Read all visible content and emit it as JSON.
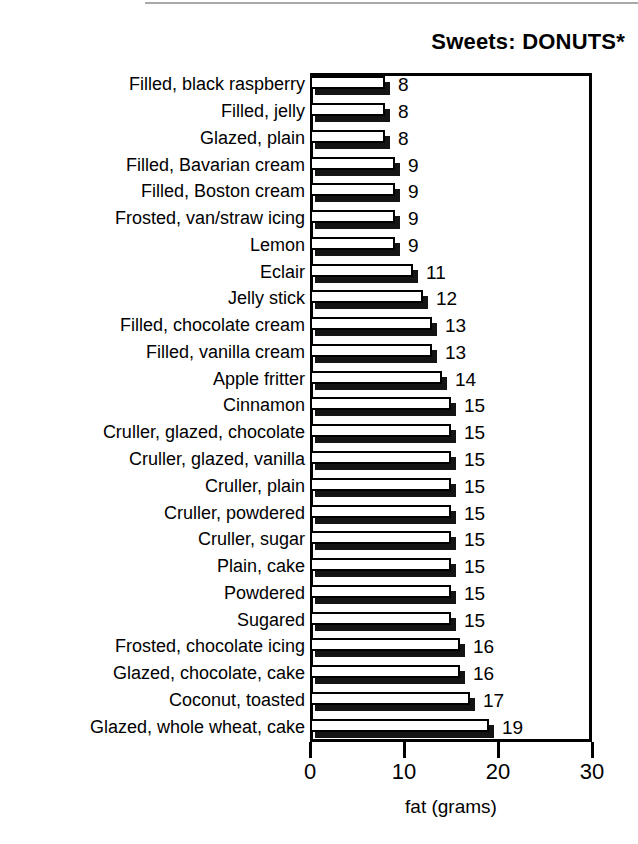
{
  "chart_data": {
    "type": "bar",
    "orientation": "horizontal",
    "title": "Sweets: DONUTS*",
    "xlabel": "fat (grams)",
    "ylabel": "",
    "xlim": [
      0,
      30
    ],
    "xticks": [
      0,
      10,
      20,
      30
    ],
    "xtick_labels": [
      "0",
      "10",
      "20",
      "30"
    ],
    "grid": false,
    "legend": false,
    "bar_style": "3d-extruded-white-face-black-shadow",
    "value_labels_shown": true,
    "categories": [
      "Filled, black raspberry",
      "Filled, jelly",
      "Glazed, plain",
      "Filled, Bavarian cream",
      "Filled, Boston cream",
      "Frosted, van/straw icing",
      "Lemon",
      "Eclair",
      "Jelly stick",
      "Filled, chocolate cream",
      "Filled, vanilla cream",
      "Apple fritter",
      "Cinnamon",
      "Cruller, glazed, chocolate",
      "Cruller, glazed, vanilla",
      "Cruller, plain",
      "Cruller, powdered",
      "Cruller, sugar",
      "Plain, cake",
      "Powdered",
      "Sugared",
      "Frosted, chocolate icing",
      "Glazed, chocolate, cake",
      "Coconut, toasted",
      "Glazed, whole wheat, cake"
    ],
    "values": [
      8,
      8,
      8,
      9,
      9,
      9,
      9,
      11,
      12,
      13,
      13,
      14,
      15,
      15,
      15,
      15,
      15,
      15,
      15,
      15,
      15,
      16,
      16,
      17,
      19
    ],
    "value_label_texts": [
      "8",
      "8",
      "8",
      "9",
      "9",
      "9",
      "9",
      "11",
      "12",
      "13",
      "13",
      "14",
      "15",
      "15",
      "15",
      "15",
      "15",
      "15",
      "15",
      "15",
      "15",
      "16",
      "16",
      "17",
      "19"
    ]
  },
  "colors": {
    "bar_face": "#ffffff",
    "bar_shadow": "#141414",
    "outline": "#000000",
    "text": "#000000",
    "background": "#ffffff"
  }
}
